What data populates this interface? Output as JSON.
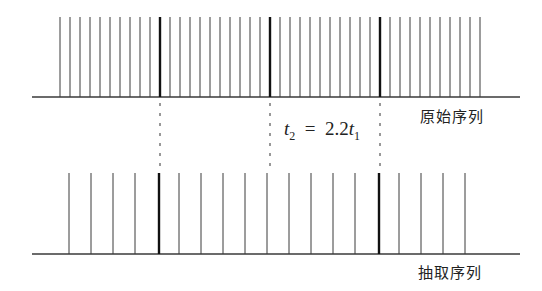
{
  "diagram": {
    "type": "sampling-decimation",
    "top_sequence": {
      "label": "原始序列",
      "baseline_y": 97,
      "top_y": 17,
      "baseline_x": [
        32,
        520
      ],
      "start_x": 60,
      "step": 10,
      "count": 43,
      "bold_x": [
        160,
        270,
        380
      ]
    },
    "bottom_sequence": {
      "label": "抽取序列",
      "baseline_y": 254,
      "top_y": 173,
      "baseline_x": [
        32,
        520
      ],
      "start_x": 69,
      "step": 22,
      "count": 19,
      "bold_x": [
        159,
        270,
        379
      ]
    },
    "alignment_dashes_x": [
      160,
      270,
      380
    ],
    "formula": {
      "lhs": "t",
      "lhs_sub": "2",
      "eq": "=",
      "coef": "2.2",
      "rhs": "t",
      "rhs_sub": "1"
    },
    "colors": {
      "line": "#3a3a3a",
      "bold": "#111111"
    }
  }
}
